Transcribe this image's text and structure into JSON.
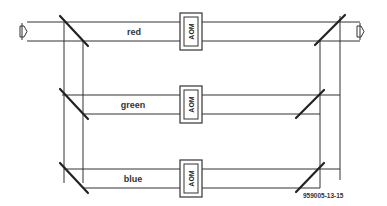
{
  "diagram": {
    "type": "optical-beam-path",
    "channels": [
      {
        "name": "red",
        "label": "red",
        "component": "AOM"
      },
      {
        "name": "green",
        "label": "green",
        "component": "AOM"
      },
      {
        "name": "blue",
        "label": "blue",
        "component": "AOM"
      }
    ],
    "input_arrow": "beam-input",
    "output_arrow": "beam-output",
    "figure_id": "959005-13-15",
    "colors": {
      "line": "#333333",
      "background": "#ffffff"
    }
  }
}
